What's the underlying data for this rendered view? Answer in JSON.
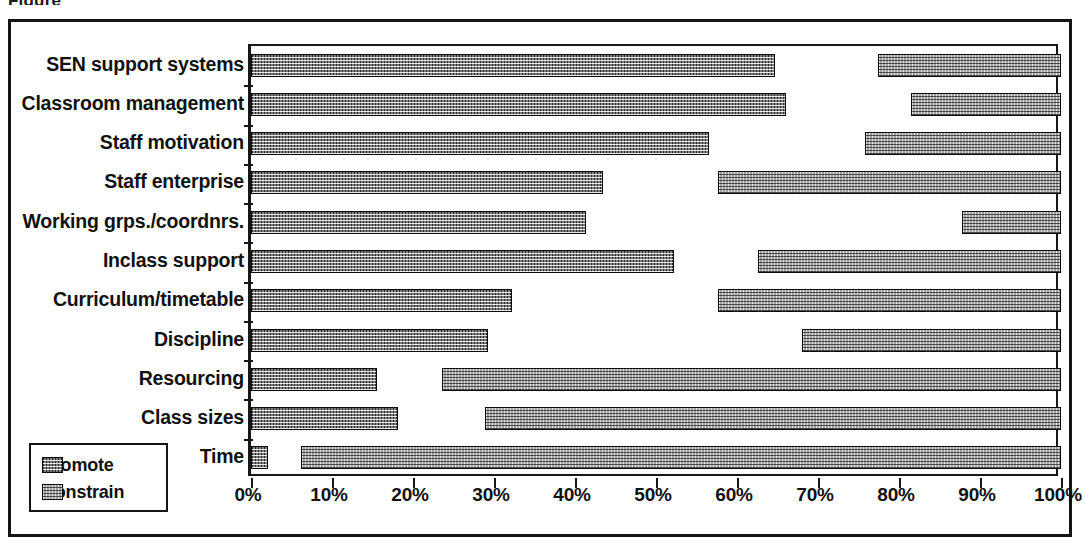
{
  "figure": {
    "top_partial_text": "Figure",
    "x_axis_title": "",
    "y_axis_title": ""
  },
  "legend": {
    "position": "bottom-left",
    "items": [
      {
        "label": "Promote",
        "color": "#2a2a2a",
        "pattern": "dark-checker"
      },
      {
        "label": "Constrain",
        "color": "#e3e3e3",
        "pattern": "light-checker"
      }
    ]
  },
  "axis": {
    "x_ticks": [
      "0%",
      "10%",
      "20%",
      "30%",
      "40%",
      "50%",
      "60%",
      "70%",
      "80%",
      "90%",
      "100%"
    ],
    "x_tick_values": [
      0,
      10,
      20,
      30,
      40,
      50,
      60,
      70,
      80,
      90,
      100
    ],
    "x_min": 0,
    "x_max": 100
  },
  "chart_data": {
    "type": "bar",
    "orientation": "horizontal",
    "title": "",
    "xlabel": "",
    "ylabel": "",
    "xlim": [
      0,
      100
    ],
    "grid": false,
    "legend_position": "bottom-left",
    "note": "Each category has a 'Promote' bar anchored at 0% and a 'Constrain' bar anchored at 100% (drawn right-to-left from the right edge).",
    "categories": [
      "SEN support systems",
      "Classroom management",
      "Staff motivation",
      "Staff enterprise",
      "Working grps./coordnrs.",
      "Inclass support",
      "Curriculum/timetable",
      "Discipline",
      "Resourcing",
      "Class sizes",
      "Time"
    ],
    "series": [
      {
        "name": "Promote",
        "anchor": "left",
        "color": "#2a2a2a",
        "values": [
          64.7,
          66.0,
          56.6,
          43.4,
          41.3,
          52.2,
          32.2,
          29.3,
          15.5,
          18.2,
          2.1
        ]
      },
      {
        "name": "Constrain",
        "anchor": "right",
        "color": "#e3e3e3",
        "start_values": [
          77.4,
          81.5,
          75.8,
          57.6,
          87.8,
          62.6,
          57.6,
          68.0,
          23.6,
          28.9,
          6.2
        ],
        "values": [
          22.6,
          18.5,
          24.2,
          42.4,
          12.2,
          37.4,
          42.4,
          32.0,
          76.4,
          71.1,
          93.8
        ]
      }
    ]
  }
}
